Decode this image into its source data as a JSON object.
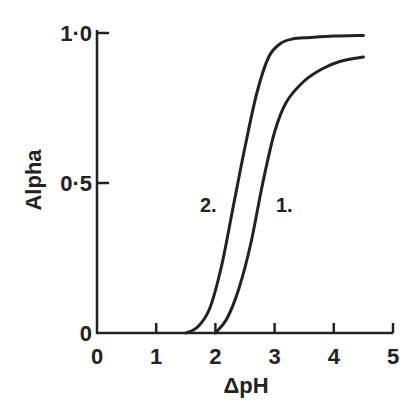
{
  "chart_data": {
    "type": "line",
    "title": "",
    "xlabel": "ΔpH",
    "ylabel": "Alpha",
    "xlim": [
      0,
      5
    ],
    "ylim": [
      0,
      1.0
    ],
    "x_ticks": [
      "0",
      "1",
      "2",
      "3",
      "4",
      "5"
    ],
    "y_ticks": [
      "0",
      "0·5",
      "1·0"
    ],
    "grid": false,
    "legend": "inline curve labels",
    "series": [
      {
        "name": "1.",
        "x": [
          2.0,
          2.2,
          2.4,
          2.6,
          2.8,
          3.0,
          3.2,
          3.5,
          3.8,
          4.1,
          4.5
        ],
        "y": [
          0.0,
          0.05,
          0.15,
          0.3,
          0.5,
          0.67,
          0.77,
          0.84,
          0.88,
          0.905,
          0.92
        ]
      },
      {
        "name": "2.",
        "x": [
          1.5,
          1.7,
          1.9,
          2.1,
          2.3,
          2.5,
          2.7,
          2.9,
          3.1,
          3.3,
          3.6,
          4.0,
          4.5
        ],
        "y": [
          0.0,
          0.02,
          0.08,
          0.22,
          0.42,
          0.62,
          0.8,
          0.92,
          0.965,
          0.98,
          0.985,
          0.99,
          0.992
        ]
      }
    ]
  }
}
